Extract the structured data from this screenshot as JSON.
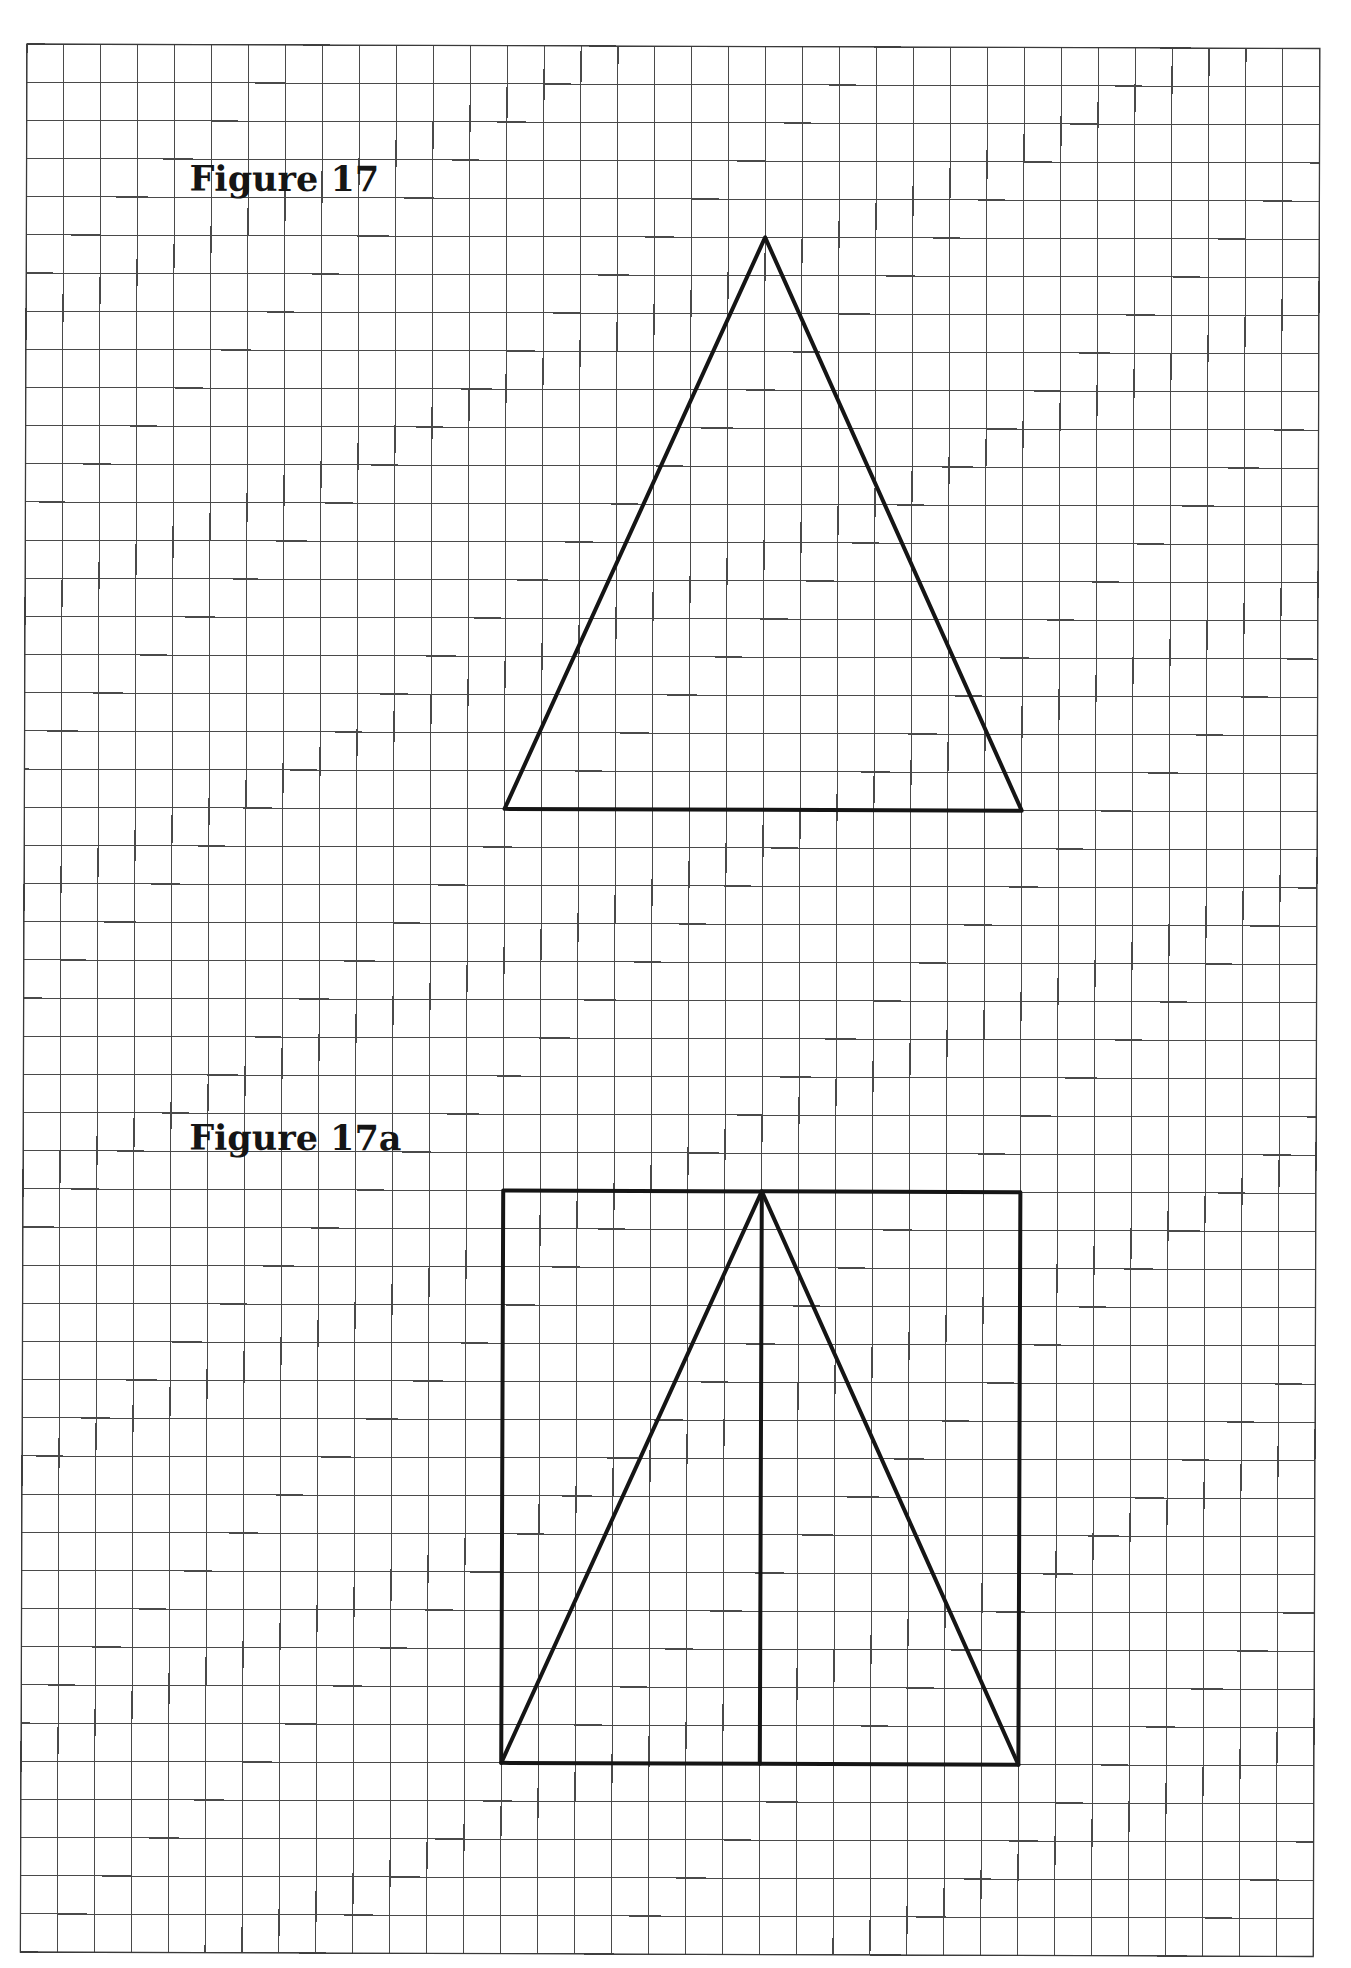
{
  "page": {
    "width": 1351,
    "height": 1968,
    "background": "#ffffff"
  },
  "grid": {
    "origin_x": 27,
    "origin_y": 44,
    "columns": 35,
    "rows": 50,
    "cell_width": 36.94,
    "cell_height": 38.16,
    "rotation_deg": 0.2,
    "line_color": "#4a4a4a"
  },
  "figures": [
    {
      "id": "figure-17",
      "label": "Figure 17",
      "label_position": {
        "x": 190,
        "y": 190
      },
      "shape": "triangle",
      "vertices_grid": [
        [
          20,
          5
        ],
        [
          13,
          20
        ],
        [
          27,
          20
        ]
      ],
      "description": "Isosceles triangle drawn on grid; base 14 units, height 15 units"
    },
    {
      "id": "figure-17a",
      "label": "Figure 17a",
      "label_position": {
        "x": 193,
        "y": 1149
      },
      "shape": "rectangle-with-inscribed-triangle",
      "rectangle_grid": {
        "x1": 13,
        "y1": 30,
        "x2": 27,
        "y2": 45
      },
      "triangle_vertices_grid": [
        [
          20,
          30
        ],
        [
          13,
          45
        ],
        [
          27,
          45
        ]
      ],
      "center_line_grid": [
        [
          20,
          30
        ],
        [
          20,
          45
        ]
      ],
      "description": "Same triangle enclosed in its bounding rectangle, with altitude drawn from apex to base"
    }
  ],
  "colors": {
    "figure_stroke": "#151515",
    "grid_stroke": "#4a4a4a",
    "label_text": "#151515"
  }
}
